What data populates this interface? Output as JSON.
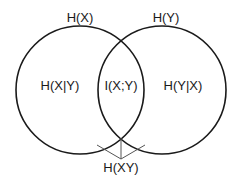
{
  "diagram": {
    "type": "venn",
    "sets": [
      {
        "id": "X",
        "label": "H(X)",
        "exclusive_label": "H(X|Y)"
      },
      {
        "id": "Y",
        "label": "H(Y)",
        "exclusive_label": "H(Y|X)"
      }
    ],
    "intersection_label": "I(X;Y)",
    "union_label": "H(XY)",
    "colors": {
      "stroke": "#1a1a1a",
      "bracket": "#555555",
      "background": "#ffffff"
    }
  }
}
